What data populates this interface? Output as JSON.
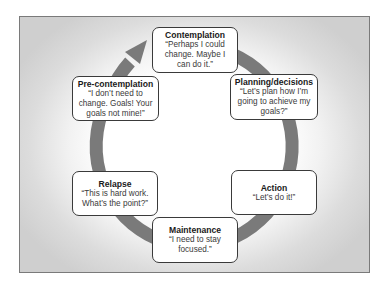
{
  "diagram": {
    "type": "cycle",
    "colors": {
      "ring": "#7a7a7a",
      "box_border": "#3a3a3a",
      "box_fill": "#ffffff",
      "frame_border": "#7a7a7a",
      "background_edge": "#cfcfcf"
    },
    "stages": [
      {
        "id": "contemplation",
        "title": "Contemplation",
        "quote": "“Perhaps I could change. Maybe I can do it.”"
      },
      {
        "id": "planning",
        "title": "Planning/decisions",
        "quote": "“Let’s plan how I’m going to achieve my goals?”"
      },
      {
        "id": "action",
        "title": "Action",
        "quote": "“Let’s do it!”"
      },
      {
        "id": "maintenance",
        "title": "Maintenance",
        "quote": "“I need to stay focused.”"
      },
      {
        "id": "relapse",
        "title": "Relapse",
        "quote": "“This is hard work. What’s the point?”"
      },
      {
        "id": "precontemplation",
        "title": "Pre-contemplation",
        "quote": "“I don’t need to change. Goals! Your goals not mine!”"
      }
    ],
    "arrow_direction": "clockwise",
    "arrow_icon": "arrowhead-icon"
  }
}
